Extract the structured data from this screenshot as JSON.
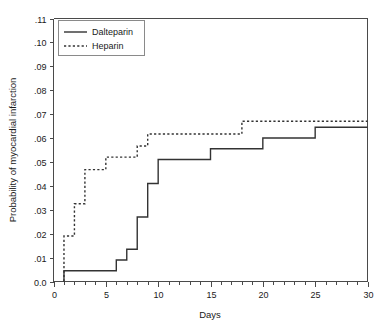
{
  "chart_data": {
    "type": "line",
    "subtype": "kaplan-meier-step",
    "title": "",
    "xlabel": "Days",
    "ylabel": "Probability of myocardial infarction",
    "xlim": [
      0,
      30
    ],
    "ylim": [
      0,
      0.11
    ],
    "grid": false,
    "legend_position": "top-left",
    "x_ticks": [
      0,
      5,
      10,
      15,
      20,
      25,
      30
    ],
    "x_tick_labels": [
      "0",
      "5",
      "10",
      "15",
      "20",
      "25",
      "30"
    ],
    "x_minor_tick_interval": 1,
    "y_ticks": [
      0,
      0.01,
      0.02,
      0.03,
      0.04,
      0.05,
      0.06,
      0.07,
      0.08,
      0.09,
      0.1,
      0.11
    ],
    "y_tick_labels": [
      "0.0",
      ".01",
      ".02",
      ".03",
      ".04",
      ".05",
      ".06",
      ".07",
      ".08",
      ".09",
      ".10",
      ".11"
    ],
    "series": [
      {
        "name": "Dalteparin",
        "style": "solid",
        "color": "#333333",
        "x": [
          1,
          1,
          6,
          7,
          8,
          9,
          10,
          15,
          20,
          25,
          30
        ],
        "y": [
          0.0,
          0.0045,
          0.009,
          0.0135,
          0.027,
          0.041,
          0.051,
          0.0555,
          0.06,
          0.0645,
          0.0645
        ],
        "steps": [
          {
            "day": 1,
            "value": 0.0045
          },
          {
            "day": 6,
            "value": 0.009
          },
          {
            "day": 7,
            "value": 0.0135
          },
          {
            "day": 8,
            "value": 0.027
          },
          {
            "day": 9,
            "value": 0.041
          },
          {
            "day": 10,
            "value": 0.051
          },
          {
            "day": 15,
            "value": 0.0555
          },
          {
            "day": 20,
            "value": 0.06
          },
          {
            "day": 25,
            "value": 0.0645
          },
          {
            "day": 30,
            "value": 0.0645
          }
        ]
      },
      {
        "name": "Heparin",
        "style": "dashed",
        "color": "#333333",
        "x": [
          1,
          1,
          2,
          3,
          5,
          8,
          9,
          18,
          30
        ],
        "y": [
          0.0,
          0.019,
          0.0325,
          0.0468,
          0.052,
          0.0567,
          0.0617,
          0.067,
          0.067
        ],
        "steps": [
          {
            "day": 1,
            "value": 0.019
          },
          {
            "day": 2,
            "value": 0.0325
          },
          {
            "day": 3,
            "value": 0.0468
          },
          {
            "day": 5,
            "value": 0.052
          },
          {
            "day": 8,
            "value": 0.0567
          },
          {
            "day": 9,
            "value": 0.0617
          },
          {
            "day": 18,
            "value": 0.067
          },
          {
            "day": 30,
            "value": 0.067
          }
        ]
      }
    ]
  },
  "legend": {
    "entries": [
      {
        "label": "Dalteparin",
        "style": "solid"
      },
      {
        "label": "Heparin",
        "style": "dashed"
      }
    ]
  },
  "axes": {
    "x_title": "Days",
    "y_title": "Probability of myocardial infarction"
  },
  "colors": {
    "line": "#333333",
    "axis": "#4a4a4a",
    "legend_border": "#8a8a8a",
    "background": "#ffffff"
  }
}
